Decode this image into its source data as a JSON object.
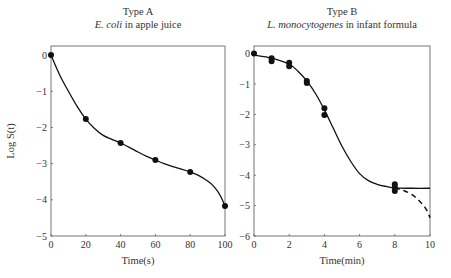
{
  "figure": {
    "ylabel": "Log S(t)"
  },
  "chart_data": [
    {
      "type": "line",
      "title": "Type A",
      "subtitle_italic": "E. coli",
      "subtitle_rest": " in apple juice",
      "xlabel": "Time(s)",
      "ylabel": "Log S(t)",
      "xlim": [
        0,
        100
      ],
      "ylim": [
        -5,
        0.25
      ],
      "xticks": [
        0,
        20,
        40,
        60,
        80,
        100
      ],
      "yticks": [
        0,
        -1,
        -2,
        -3,
        -4,
        -5
      ],
      "grid": false,
      "series": [
        {
          "name": "observed",
          "kind": "points",
          "x": [
            0,
            20,
            40,
            60,
            80,
            100
          ],
          "y": [
            0,
            -1.77,
            -2.43,
            -2.9,
            -3.23,
            -4.17
          ]
        },
        {
          "name": "fitted",
          "kind": "solid-curve",
          "x": [
            0,
            5,
            10,
            15,
            20,
            25,
            30,
            35,
            40,
            45,
            50,
            55,
            60,
            65,
            70,
            75,
            80,
            85,
            90,
            93,
            96,
            98,
            100
          ],
          "y": [
            0,
            -0.55,
            -1.0,
            -1.42,
            -1.77,
            -2.03,
            -2.22,
            -2.33,
            -2.43,
            -2.55,
            -2.68,
            -2.8,
            -2.9,
            -3.0,
            -3.08,
            -3.15,
            -3.23,
            -3.33,
            -3.48,
            -3.6,
            -3.78,
            -3.95,
            -4.17
          ]
        }
      ]
    },
    {
      "type": "line",
      "title": "Type B",
      "subtitle_italic": "L. monocytogenes",
      "subtitle_rest": " in infant formula",
      "xlabel": "Time(min)",
      "ylabel": "",
      "xlim": [
        0,
        10
      ],
      "ylim": [
        -6,
        0.25
      ],
      "xticks": [
        0,
        2,
        4,
        6,
        8,
        10
      ],
      "yticks": [
        0,
        -1,
        -2,
        -3,
        -4,
        -5,
        -6
      ],
      "grid": false,
      "series": [
        {
          "name": "observed",
          "kind": "points",
          "x": [
            0,
            1,
            1,
            2,
            2,
            3,
            3,
            4,
            4,
            8,
            8,
            8
          ],
          "y": [
            0,
            -0.15,
            -0.25,
            -0.3,
            -0.42,
            -0.9,
            -0.97,
            -1.8,
            -2.02,
            -4.3,
            -4.4,
            -4.52
          ]
        },
        {
          "name": "fitted (plateau)",
          "kind": "solid-curve",
          "x": [
            0,
            1,
            2,
            2.5,
            3,
            3.5,
            4,
            4.5,
            5,
            5.5,
            6,
            6.5,
            7,
            7.5,
            8,
            9,
            10
          ],
          "y": [
            -0.05,
            -0.15,
            -0.35,
            -0.58,
            -0.9,
            -1.32,
            -1.85,
            -2.45,
            -3.05,
            -3.55,
            -3.95,
            -4.18,
            -4.3,
            -4.37,
            -4.42,
            -4.43,
            -4.43
          ]
        },
        {
          "name": "fitted (decline)",
          "kind": "dashed-curve",
          "x": [
            8,
            8.5,
            9,
            9.4,
            9.7,
            9.9,
            10
          ],
          "y": [
            -4.42,
            -4.5,
            -4.65,
            -4.85,
            -5.05,
            -5.25,
            -5.4
          ]
        }
      ]
    }
  ]
}
